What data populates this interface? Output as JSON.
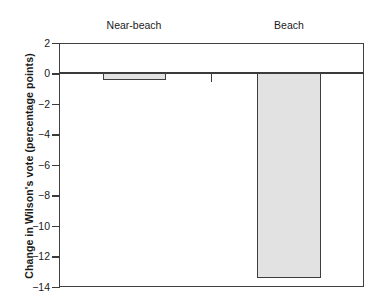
{
  "chart_data": {
    "type": "bar",
    "title": "",
    "subtitle": "",
    "xlabel": "",
    "ylabel": "Change in Wilson's vote (percentage points)",
    "categories": [
      "Near-beach townships",
      "Beach townships"
    ],
    "category_lines": [
      [
        "Near-beach",
        "townships"
      ],
      [
        "Beach",
        "townships"
      ]
    ],
    "values": [
      -0.45,
      -13.4
    ],
    "ylim": [
      -14,
      2
    ],
    "yticks": [
      2,
      0,
      -2,
      -4,
      -6,
      -8,
      -10,
      -12,
      -14
    ],
    "ytick_labels": [
      "2",
      "0",
      "−2",
      "−4",
      "−6",
      "−8",
      "−10",
      "−12",
      "−14"
    ],
    "grid": false,
    "legend": false,
    "legend_position": "none",
    "bar_fill_color": "#e2e2e2",
    "bar_border_color": "#3d3d3d",
    "axis_color": "#3a3a3a",
    "background_color": "#ffffff"
  },
  "axis": {
    "y_title": "Change in Wilson's vote (percentage points)"
  },
  "labels": {
    "cat0_line1": "Near-beach",
    "cat0_line2": "townships",
    "cat1_line1": "Beach",
    "cat1_line2": "townships"
  },
  "yticks": {
    "t0": "2",
    "t1": "0",
    "t2": "−2",
    "t3": "−4",
    "t4": "−6",
    "t5": "−8",
    "t6": "−10",
    "t7": "−12",
    "t8": "−14"
  }
}
